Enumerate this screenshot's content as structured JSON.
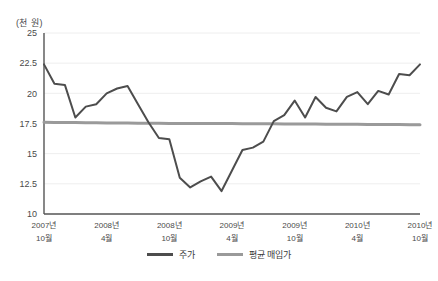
{
  "chart_data": {
    "type": "line",
    "title": "",
    "subtitle": "",
    "unit_label": "(천 원)",
    "xlabel": "",
    "ylabel": "",
    "ylim": [
      10,
      25
    ],
    "yticks": [
      "25",
      "22.5",
      "20",
      "17.5",
      "15",
      "12.5",
      "10"
    ],
    "ytick_values": [
      25,
      22.5,
      20,
      17.5,
      15,
      12.5,
      10
    ],
    "grid": "horizontal-light",
    "legend_position": "bottom-center",
    "x": [
      "2007-10",
      "2007-11",
      "2007-12",
      "2008-01",
      "2008-02",
      "2008-03",
      "2008-04",
      "2008-05",
      "2008-06",
      "2008-07",
      "2008-08",
      "2008-09",
      "2008-10",
      "2008-11",
      "2008-12",
      "2009-01",
      "2009-02",
      "2009-03",
      "2009-04",
      "2009-05",
      "2009-06",
      "2009-07",
      "2009-08",
      "2009-09",
      "2009-10",
      "2009-11",
      "2009-12",
      "2010-01",
      "2010-02",
      "2010-03",
      "2010-04",
      "2010-05",
      "2010-06",
      "2010-07",
      "2010-08",
      "2010-09",
      "2010-10"
    ],
    "xticks": [
      {
        "index": 0,
        "line1": "2007년",
        "line2": "10월"
      },
      {
        "index": 6,
        "line1": "2008년",
        "line2": "4월"
      },
      {
        "index": 12,
        "line1": "2008년",
        "line2": "10월"
      },
      {
        "index": 18,
        "line1": "2009년",
        "line2": "4월"
      },
      {
        "index": 24,
        "line1": "2009년",
        "line2": "10월"
      },
      {
        "index": 30,
        "line1": "2010년",
        "line2": "4월"
      },
      {
        "index": 36,
        "line1": "2010년",
        "line2": "10월"
      }
    ],
    "series": [
      {
        "name": "주가",
        "color": "#4d4d4d",
        "width": 2,
        "values": [
          22.4,
          20.8,
          20.7,
          18.0,
          18.9,
          19.1,
          20.0,
          20.4,
          20.6,
          19.1,
          17.6,
          16.3,
          16.2,
          13.0,
          12.2,
          12.7,
          13.1,
          11.9,
          13.6,
          15.3,
          15.5,
          16.0,
          17.7,
          18.2,
          19.4,
          18.0,
          19.7,
          18.8,
          18.5,
          19.7,
          20.1,
          19.1,
          20.2,
          19.9,
          21.6,
          21.5,
          22.4
        ]
      },
      {
        "name": "평균 매입가",
        "color": "#9a9a9a",
        "width": 3,
        "constant": 17.5,
        "values": [
          17.6,
          17.59,
          17.58,
          17.58,
          17.57,
          17.56,
          17.55,
          17.55,
          17.54,
          17.53,
          17.53,
          17.52,
          17.51,
          17.51,
          17.5,
          17.5,
          17.5,
          17.49,
          17.49,
          17.48,
          17.48,
          17.47,
          17.47,
          17.46,
          17.46,
          17.45,
          17.45,
          17.44,
          17.44,
          17.43,
          17.43,
          17.42,
          17.42,
          17.41,
          17.41,
          17.4,
          17.4
        ]
      }
    ],
    "legend": [
      {
        "label": "주가",
        "color": "#4d4d4d"
      },
      {
        "label": "평균 매입가",
        "color": "#9a9a9a"
      }
    ]
  }
}
